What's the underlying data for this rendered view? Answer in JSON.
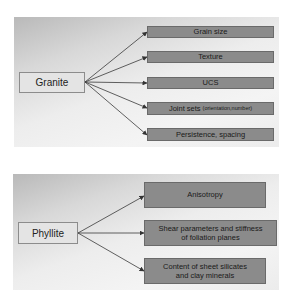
{
  "granite": {
    "root_label": "Granite",
    "items": [
      {
        "label": "Grain size",
        "sub": ""
      },
      {
        "label": "Texture",
        "sub": ""
      },
      {
        "label": "UCS",
        "sub": ""
      },
      {
        "label": "Joint sets",
        "sub": "(orientation,number)"
      },
      {
        "label": "Persistence, spacing",
        "sub": ""
      }
    ]
  },
  "phyllite": {
    "root_label": "Phyllite",
    "items": [
      {
        "line1": "Anisotropy",
        "line2": ""
      },
      {
        "line1": "Shear parameters and stiffness",
        "line2": "of foliation planes"
      },
      {
        "line1": "Content of sheet silicates",
        "line2": "and clay minerals"
      }
    ]
  },
  "colors": {
    "leaf_fill": "#8b8b8b",
    "root_fill": "#e4e4e4",
    "connector": "#333333"
  }
}
